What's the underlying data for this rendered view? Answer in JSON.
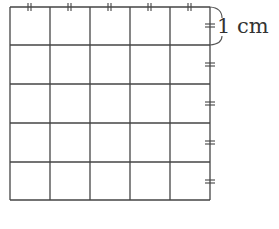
{
  "diagram": {
    "type": "grid",
    "rows": 5,
    "columns": 5,
    "unit_label": "1 cm",
    "line_color": "#444444",
    "background": "#ffffff",
    "tick_marks": {
      "top_edge_columns_marked": 5,
      "right_edge_rows_marked": 5,
      "style": "double-hash"
    }
  }
}
